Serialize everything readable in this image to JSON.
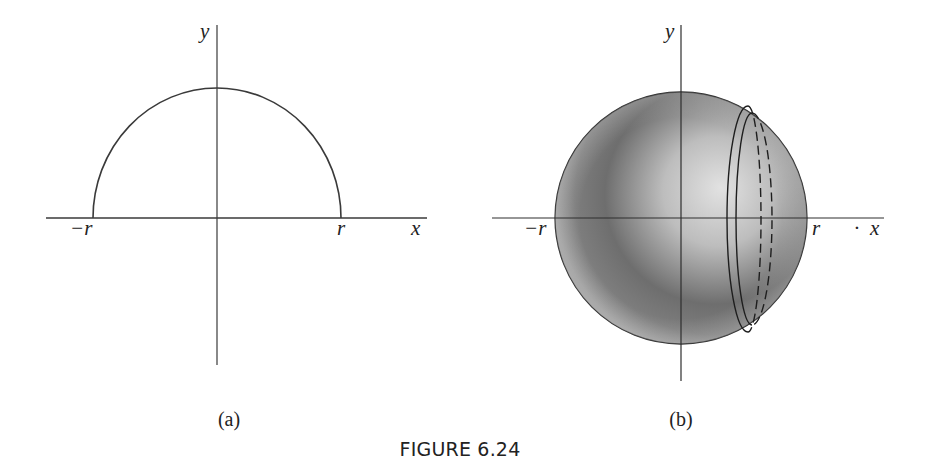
{
  "figure": {
    "caption": "FIGURE 6.24",
    "panels": [
      {
        "id": "a",
        "label": "(a)",
        "description": "Upper semicircle of radius r centered at origin",
        "axes": {
          "x_label": "x",
          "y_label": "y"
        },
        "ticks": {
          "neg_r": "−r",
          "pos_r": "r"
        }
      },
      {
        "id": "b",
        "label": "(b)",
        "description": "Sphere of radius r generated by revolving semicircle about x-axis, with a thin slab shown near x = r",
        "axes": {
          "x_label": "x",
          "y_label": "y"
        },
        "ticks": {
          "neg_r": "−r",
          "pos_r": "r"
        },
        "stray_mark": "·"
      }
    ]
  },
  "colors": {
    "line": "#3a3a3a",
    "sphere_dark": "#4a4a4a",
    "sphere_light": "#dcdcdc",
    "background": "#ffffff"
  }
}
